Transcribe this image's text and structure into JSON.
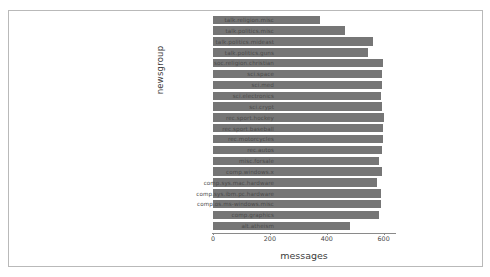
{
  "chart_data": {
    "type": "bar",
    "orientation": "horizontal",
    "title": "",
    "xlabel": "messages",
    "ylabel": "newsgroup",
    "xlim": [
      0,
      640
    ],
    "xticks": [
      0,
      200,
      400,
      600
    ],
    "xtick_labels": [
      "0",
      "200",
      "400",
      "600"
    ],
    "grid": false,
    "legend": false,
    "bar_color": "#767676",
    "categories": [
      "talk.religion.misc",
      "talk.politics.misc",
      "talk.politics.mideast",
      "talk.politics.guns",
      "soc.religion.christian",
      "sci.space",
      "sci.med",
      "sci.electronics",
      "sci.crypt",
      "rec.sport.hockey",
      "rec.sport.baseball",
      "rec.motorcycles",
      "rec.autos",
      "misc.forsale",
      "comp.windows.x",
      "comp.sys.mac.hardware",
      "comp.sys.ibm.pc.hardware",
      "comp.os.ms-windows.misc",
      "comp.graphics",
      "alt.atheism"
    ],
    "values": [
      377,
      465,
      564,
      546,
      599,
      593,
      594,
      591,
      595,
      600,
      597,
      598,
      594,
      585,
      593,
      578,
      590,
      591,
      584,
      480
    ]
  },
  "figure": {
    "background": "#ffffff",
    "frame_color": "#b9b9b9",
    "axis_color": "#8a8a8a",
    "text_color": "#4a4a4a"
  }
}
